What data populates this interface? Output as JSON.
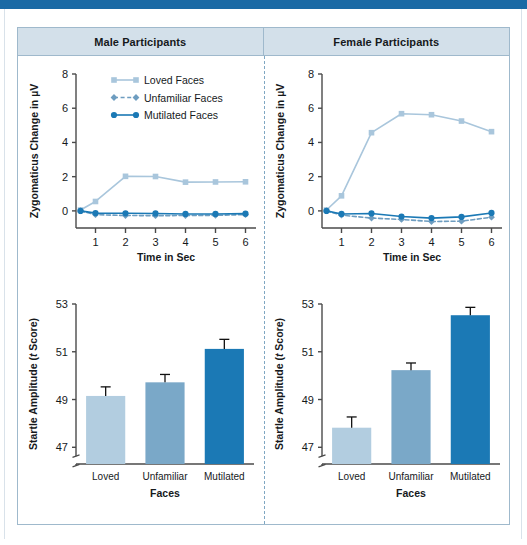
{
  "figure": {
    "panels": [
      {
        "id": "male",
        "title": "Male Participants"
      },
      {
        "id": "female",
        "title": "Female Participants"
      }
    ]
  },
  "palette": {
    "loved": "#a9c6dc",
    "unfamiliar": "#6e9dc0",
    "mutilated": "#1b79b5",
    "bar_loved": "#b2cde0",
    "bar_unfamiliar": "#7aa8c8",
    "bar_mutilated": "#1b79b5",
    "axis": "#4a4a4a",
    "header_band": "#d3e0ea",
    "frame": "#9fb9cc",
    "top_band": "#1b6aa5",
    "divider": "#7fa7c2"
  },
  "legend": {
    "items": [
      {
        "label": "Loved Faces",
        "marker": "square",
        "line": "solid",
        "color": "#a9c6dc"
      },
      {
        "label": "Unfamiliar Faces",
        "marker": "diamond",
        "line": "dashed",
        "color": "#6e9dc0"
      },
      {
        "label": "Mutilated Faces",
        "marker": "circle",
        "line": "solid",
        "color": "#1b79b5"
      }
    ]
  },
  "chart_data": [
    {
      "id": "male-zygomaticus",
      "type": "line",
      "title": "Male Participants",
      "xlabel": "Time in Sec",
      "ylabel": "Zygomaticus Change in µV",
      "x": [
        0.5,
        1,
        2,
        3,
        4,
        5,
        6
      ],
      "xticks": [
        1,
        2,
        3,
        4,
        5,
        6
      ],
      "yticks": [
        0,
        2,
        4,
        6,
        8
      ],
      "xlim": [
        0.35,
        6.35
      ],
      "ylim": [
        -1.0,
        8.0
      ],
      "grid": false,
      "legend_position": "top-right-inside",
      "series": [
        {
          "name": "Loved Faces",
          "color": "#a9c6dc",
          "marker": "square",
          "line": "solid",
          "values": [
            0.05,
            0.55,
            2.02,
            2.01,
            1.68,
            1.69,
            1.7
          ]
        },
        {
          "name": "Unfamiliar Faces",
          "color": "#6e9dc0",
          "marker": "diamond",
          "line": "dashed",
          "values": [
            0.0,
            -0.22,
            -0.27,
            -0.28,
            -0.27,
            -0.26,
            -0.22
          ]
        },
        {
          "name": "Mutilated Faces",
          "color": "#1b79b5",
          "marker": "circle",
          "line": "solid",
          "values": [
            0.0,
            -0.13,
            -0.14,
            -0.15,
            -0.18,
            -0.18,
            -0.16
          ]
        }
      ]
    },
    {
      "id": "female-zygomaticus",
      "type": "line",
      "title": "Female Participants",
      "xlabel": "Time in Sec",
      "ylabel": "Zygomaticus Change in µV",
      "x": [
        0.5,
        1,
        2,
        3,
        4,
        5,
        6
      ],
      "xticks": [
        1,
        2,
        3,
        4,
        5,
        6
      ],
      "yticks": [
        0,
        2,
        4,
        6,
        8
      ],
      "xlim": [
        0.35,
        6.35
      ],
      "ylim": [
        -1.0,
        8.0
      ],
      "grid": false,
      "legend_position": "none",
      "series": [
        {
          "name": "Loved Faces",
          "color": "#a9c6dc",
          "marker": "square",
          "line": "solid",
          "values": [
            0.05,
            0.88,
            4.57,
            5.68,
            5.62,
            5.25,
            4.63
          ]
        },
        {
          "name": "Unfamiliar Faces",
          "color": "#6e9dc0",
          "marker": "diamond",
          "line": "dashed",
          "values": [
            0.0,
            -0.25,
            -0.42,
            -0.5,
            -0.62,
            -0.6,
            -0.37
          ]
        },
        {
          "name": "Mutilated Faces",
          "color": "#1b79b5",
          "marker": "circle",
          "line": "solid",
          "values": [
            0.0,
            -0.18,
            -0.15,
            -0.33,
            -0.42,
            -0.35,
            -0.12
          ]
        }
      ]
    },
    {
      "id": "male-startle",
      "type": "bar",
      "title": "Male Participants",
      "xlabel": "Faces",
      "ylabel_prefix": "Startle Amplitude (",
      "ylabel_italic": "t",
      "ylabel_suffix": " Score)",
      "categories": [
        "Loved",
        "Unfamiliar",
        "Mutilated"
      ],
      "values": [
        49.15,
        49.72,
        51.12
      ],
      "errors": [
        0.38,
        0.33,
        0.4
      ],
      "yticks": [
        47,
        49,
        51,
        53
      ],
      "ylim": [
        46.3,
        53.0
      ],
      "axis_break": true,
      "grid": false,
      "colors": [
        "#b2cde0",
        "#7aa8c8",
        "#1b79b5"
      ]
    },
    {
      "id": "female-startle",
      "type": "bar",
      "title": "Female Participants",
      "xlabel": "Faces",
      "ylabel_prefix": "Startle Amplitude (",
      "ylabel_italic": "t",
      "ylabel_suffix": " Score)",
      "categories": [
        "Loved",
        "Unfamiliar",
        "Mutilated"
      ],
      "values": [
        47.82,
        50.23,
        52.53
      ],
      "errors": [
        0.45,
        0.3,
        0.33
      ],
      "yticks": [
        47,
        49,
        51,
        53
      ],
      "ylim": [
        46.3,
        53.0
      ],
      "axis_break": true,
      "grid": false,
      "colors": [
        "#b2cde0",
        "#7aa8c8",
        "#1b79b5"
      ]
    }
  ]
}
